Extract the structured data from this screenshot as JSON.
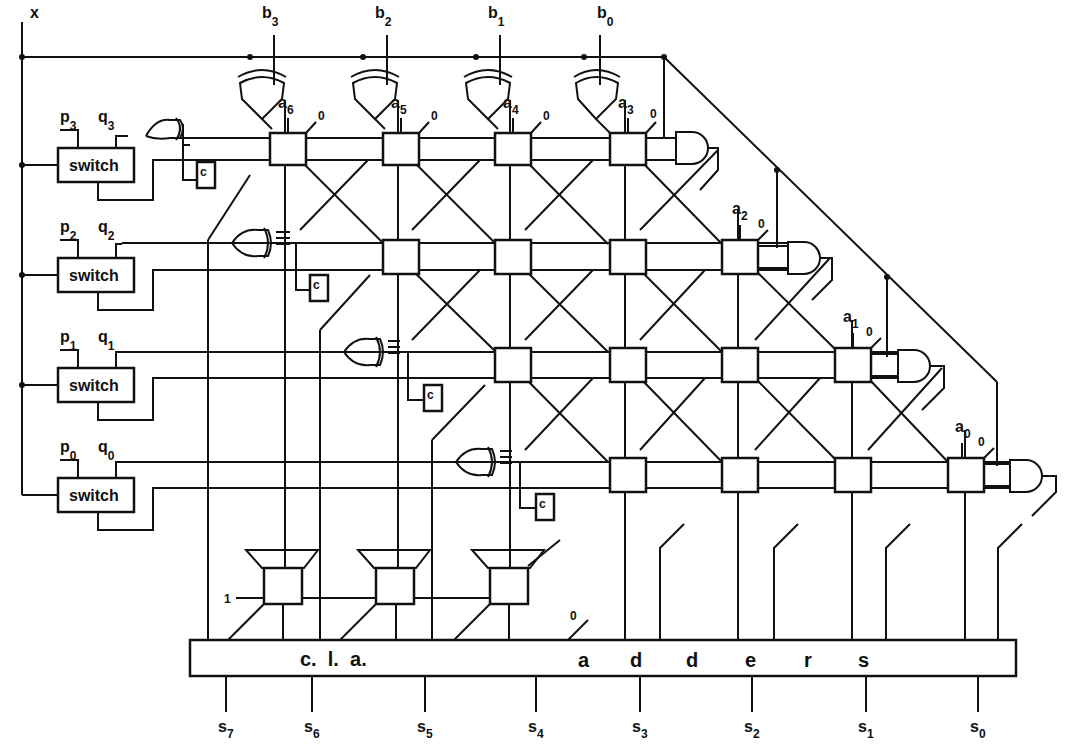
{
  "diagram": {
    "title": "",
    "global_input": {
      "label": "x"
    },
    "b_inputs": [
      {
        "label": "b",
        "sub": "3",
        "x": 274
      },
      {
        "label": "b",
        "sub": "2",
        "x": 387
      },
      {
        "label": "b",
        "sub": "1",
        "x": 500
      },
      {
        "label": "b",
        "sub": "0",
        "x": 600
      }
    ],
    "switches": [
      {
        "label": "switch",
        "p": "p",
        "p_sub": "3",
        "q": "q",
        "q_sub": "3",
        "y": 165
      },
      {
        "label": "switch",
        "p": "p",
        "p_sub": "2",
        "q": "q",
        "q_sub": "2",
        "y": 275
      },
      {
        "label": "switch",
        "p": "p",
        "p_sub": "1",
        "q": "q",
        "q_sub": "1",
        "y": 385
      },
      {
        "label": "switch",
        "p": "p",
        "p_sub": "0",
        "q": "q",
        "q_sub": "0",
        "y": 495
      }
    ],
    "a_labels": [
      {
        "label": "a",
        "sub": "6",
        "zero": "0"
      },
      {
        "label": "a",
        "sub": "5",
        "zero": "0"
      },
      {
        "label": "a",
        "sub": "4",
        "zero": "0"
      },
      {
        "label": "a",
        "sub": "3",
        "zero": "0"
      },
      {
        "label": "a",
        "sub": "2",
        "zero": "0"
      },
      {
        "label": "a",
        "sub": "1",
        "zero": "0"
      },
      {
        "label": "a",
        "sub": "0",
        "zero": "0"
      }
    ],
    "carry_box_label": "c",
    "carry_box_sub": "1",
    "constant_one": "1",
    "constant_zero": "0",
    "adder_bar": {
      "left_text": "c.  l.  a.",
      "right_letters": [
        "a",
        "d",
        "d",
        "e",
        "r",
        "s"
      ]
    },
    "outputs": [
      {
        "label": "s",
        "sub": "7"
      },
      {
        "label": "s",
        "sub": "6"
      },
      {
        "label": "s",
        "sub": "5"
      },
      {
        "label": "s",
        "sub": "4"
      },
      {
        "label": "s",
        "sub": "3"
      },
      {
        "label": "s",
        "sub": "2"
      },
      {
        "label": "s",
        "sub": "1"
      },
      {
        "label": "s",
        "sub": "0"
      }
    ]
  }
}
